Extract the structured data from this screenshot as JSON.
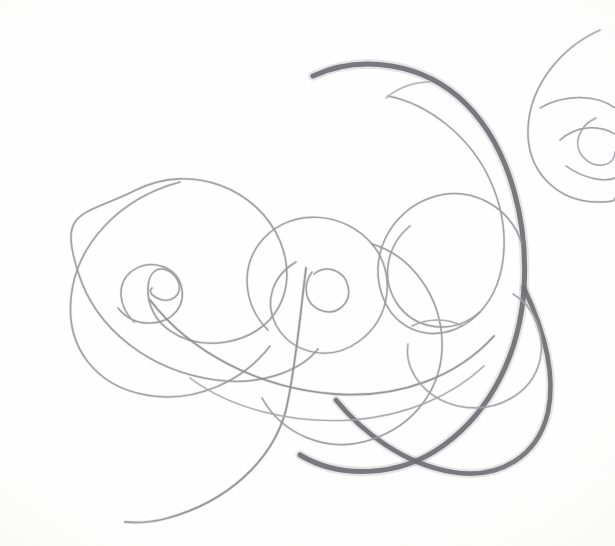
{
  "artwork": {
    "title": "Abstract Pencil Spiral Composition",
    "medium": "graphite pencil on paper",
    "subject": "interlocking spiral and arc flourishes",
    "canvas": {
      "width": 615,
      "height": 546
    },
    "background_color": "#fefefe",
    "palette": {
      "paper": "#fefefe",
      "graphite_dark": "#6f6f75",
      "graphite_mid": "#8a8a90",
      "graphite_light": "#a3a3a8",
      "graphite_faint": "#b6b6bb"
    }
  },
  "chart_data": {
    "type": "line",
    "xlabel": "",
    "ylabel": "",
    "xlim": [
      0,
      615
    ],
    "ylim": [
      0,
      546
    ],
    "grid": false,
    "legend": "none",
    "series": [
      {
        "name": "bold-sweep",
        "color": "#6f6f75",
        "width": 5.0,
        "role": "primary dark comma sweep from upper-left across to lower-right hook",
        "path": "M 313 76 C 360 54 424 62 466 104 C 512 150 528 226 524 288 C 520 352 492 410 444 445 C 398 479 338 478 300 455"
      },
      {
        "name": "bold-sweep-lower-hook",
        "color": "#6f6f75",
        "width": 4.6,
        "role": "continuation of the dark sweep curling under toward the lower-right lobe",
        "path": "M 524 288 C 544 330 556 374 548 412 C 538 456 500 480 452 472 C 404 464 362 432 336 400"
      },
      {
        "name": "left-spiral",
        "color": "#9a9a9e",
        "width": 1.6,
        "role": "large left spiral winding inward to a tight teardrop eye",
        "path": "M 318 349 C 300 372 258 386 216 380 C 150 371 96 330 78 272 C 58 208 82 217 136 190 C 192 162 258 189 280 241 C 300 290 275 334 226 342 C 182 349 146 323 148 287 C 150 262 171 266 178 281 C 184 295 170 305 157 298 C 148 293 150 290 152 288"
      },
      {
        "name": "left-spiral-outer",
        "color": "#9a9a9e",
        "width": 1.6,
        "role": "outer sweep of left spiral arcing over the top and down the left flank",
        "path": "M 180 182 C 120 198 76 244 71 298 C 66 348 96 386 146 395 C 196 404 244 380 270 346"
      },
      {
        "name": "left-spiral-eye",
        "color": "#9a9a9e",
        "width": 1.5,
        "role": "tight inner teardrop eye of the left spiral",
        "path": "M 134 322 C 118 306 116 283 132 271 C 150 258 175 266 181 285 C 187 306 172 322 152 323 C 138 324 126 318 118 308"
      },
      {
        "name": "centre-spiral",
        "color": "#9a9a9e",
        "width": 1.5,
        "role": "middle spiral with a small tight eye and a wide outer loop",
        "path": "M 296 262 C 272 276 264 302 276 325 C 292 354 330 362 358 342 C 392 318 396 272 372 244 C 344 211 292 208 264 238 C 238 266 244 306 268 330"
      },
      {
        "name": "centre-spiral-eye",
        "color": "#9a9a9e",
        "width": 1.5,
        "role": "tight inner eye of the centre spiral",
        "path": "M 312 272 C 302 286 305 304 320 310 C 338 317 352 302 348 286 C 344 270 326 264 314 274"
      },
      {
        "name": "centre-spiral-outer",
        "color": "#9a9a9e",
        "width": 1.5,
        "role": "outer arm of the centre spiral swinging right and down past the bold sweep",
        "path": "M 372 244 C 412 256 440 296 442 340 C 444 388 414 426 370 440 C 326 454 282 434 262 398"
      },
      {
        "name": "tail-sweep",
        "color": "#8e8e94",
        "width": 1.8,
        "role": "long trailing tail falling from the centre spiral to the lower-left corner",
        "path": "M 306 268 C 300 316 296 366 286 410 C 272 462 226 502 168 518 C 150 523 136 523 125 522"
      },
      {
        "name": "long-cross-arc",
        "color": "#8e8e94",
        "width": 1.8,
        "role": "broad shallow arc crossing the composition from the left spiral to the right",
        "path": "M 150 300 C 190 352 258 388 334 394 C 400 399 458 376 494 336"
      },
      {
        "name": "lower-light-arc",
        "color": "#a8a8ad",
        "width": 1.4,
        "role": "light secondary arc beneath the long cross arc",
        "path": "M 190 378 C 230 408 290 424 352 420 C 406 416 452 396 484 366"
      },
      {
        "name": "upper-inner-spiral",
        "color": "#9a9a9e",
        "width": 1.5,
        "role": "lighter spiral nested inside the bold sweep in the upper right",
        "path": "M 388 96 C 428 104 470 136 490 180 C 512 228 508 282 480 312 C 448 346 400 338 384 300 C 366 258 390 212 430 198 C 470 184 510 206 522 244"
      },
      {
        "name": "upper-inner-spiral-lobe",
        "color": "#9a9a9e",
        "width": 1.5,
        "role": "closing lobe of the upper inner spiral curling back beneath itself",
        "path": "M 480 312 C 452 336 414 330 396 302 C 380 276 388 244 410 226"
      },
      {
        "name": "right-edge-spiral",
        "color": "#9a9a9e",
        "width": 1.5,
        "role": "spiral cropped by the right edge of the page, eye near (600,140)",
        "path": "M 600 30 C 560 48 530 86 528 128 C 526 172 558 202 598 202 C 615 202 615 200 615 198"
      },
      {
        "name": "right-edge-spiral-inner",
        "color": "#9a9a9e",
        "width": 1.4,
        "role": "inner turn of the right edge spiral",
        "path": "M 540 108 C 564 94 596 94 615 108 M 560 140 C 576 126 598 124 615 134 M 566 166 C 586 180 606 182 615 178"
      },
      {
        "name": "right-edge-spiral-eye",
        "color": "#a3a3a8",
        "width": 1.4,
        "role": "small eye of the right edge spiral",
        "path": "M 596 118 C 578 126 572 146 584 158 C 596 170 615 166 615 152"
      },
      {
        "name": "lower-right-inner-hook",
        "color": "#a3a3a8",
        "width": 1.5,
        "role": "light hook nested inside the dark lower-right lobe",
        "path": "M 513 294 C 534 306 546 334 540 360 C 532 394 496 414 458 406 C 424 398 404 370 408 344"
      },
      {
        "name": "lower-right-inner-hook-tip",
        "color": "#a8a8ad",
        "width": 1.4,
        "role": "faint tip of the inner hook trailing off",
        "path": "M 412 326 C 428 318 448 318 462 326"
      },
      {
        "name": "upper-faint-arc",
        "color": "#b0b0b5",
        "width": 1.3,
        "role": "faint short arc at the start of the upper inner spiral",
        "path": "M 386 98 C 398 88 414 82 430 82"
      }
    ]
  }
}
